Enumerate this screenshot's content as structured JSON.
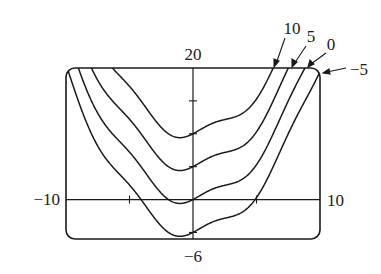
{
  "chart_data": {
    "type": "line",
    "title": "",
    "function": "y = x^2/4 + sin(x) + c",
    "xlabel": "",
    "ylabel": "",
    "xlim": [
      -10,
      10
    ],
    "ylim": [
      -6,
      20
    ],
    "grid": false,
    "x_ticks": [
      -5,
      5
    ],
    "y_ticks": [
      15,
      10,
      5,
      0,
      -5
    ],
    "window_labels": {
      "ymax": "20",
      "ymin": "−6",
      "xmin": "−10",
      "xmax": "10"
    },
    "series": [
      {
        "name": "10",
        "c": 10,
        "label": "10"
      },
      {
        "name": "5",
        "c": 5,
        "label": "5"
      },
      {
        "name": "0",
        "c": 0,
        "label": "0"
      },
      {
        "name": "-5",
        "c": -5,
        "label": "−5"
      }
    ],
    "colors": {
      "line": "#1a1a1a",
      "frame": "#1a1a1a"
    }
  }
}
